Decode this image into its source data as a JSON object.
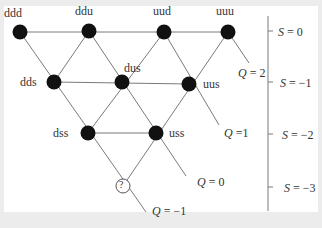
{
  "diagram": {
    "nodes": [
      {
        "id": "ddd",
        "label": "ddd",
        "x": 20,
        "y": 32,
        "filled": true
      },
      {
        "id": "ddu",
        "label": "ddu",
        "x": 89,
        "y": 31,
        "filled": true
      },
      {
        "id": "uud",
        "label": "uud",
        "x": 164,
        "y": 32,
        "filled": true
      },
      {
        "id": "uuu",
        "label": "uuu",
        "x": 228,
        "y": 32,
        "filled": true
      },
      {
        "id": "dds",
        "label": "dds",
        "x": 54,
        "y": 82,
        "filled": true
      },
      {
        "id": "dus",
        "label": "dus",
        "x": 122,
        "y": 82,
        "filled": true
      },
      {
        "id": "uus",
        "label": "uus",
        "x": 189,
        "y": 84,
        "filled": true
      },
      {
        "id": "dss",
        "label": "dss",
        "x": 88,
        "y": 133,
        "filled": true
      },
      {
        "id": "uss",
        "label": "uss",
        "x": 156,
        "y": 133,
        "filled": true
      },
      {
        "id": "unknown",
        "label": "?",
        "x": 123,
        "y": 186,
        "filled": false
      }
    ],
    "charge_labels": [
      {
        "label": "Q = 2",
        "q": "Q",
        "eq": "= 2"
      },
      {
        "label": "Q =1",
        "q": "Q",
        "eq": "=1"
      },
      {
        "label": "Q = 0",
        "q": "Q",
        "eq": "= 0"
      },
      {
        "label": "Q = −1",
        "q": "Q",
        "eq": "= −1"
      }
    ],
    "strangeness_axis": {
      "ticks": [
        {
          "label": "S = 0",
          "s": "S",
          "eq": "= 0"
        },
        {
          "label": "S = −1",
          "s": "S",
          "eq": "= −1"
        },
        {
          "label": "S = −2",
          "s": "S",
          "eq": "= −2"
        },
        {
          "label": "S = −3",
          "s": "S",
          "eq": "= −3"
        }
      ]
    },
    "colors": {
      "node_fill": "#111111",
      "line": "#7a7a7a",
      "background": "#ececec",
      "panel": "#ffffff"
    }
  }
}
